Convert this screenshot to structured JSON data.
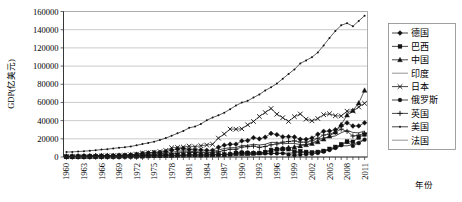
{
  "chart_data": {
    "type": "line",
    "title": "",
    "xlabel": "年份",
    "ylabel": "GDP(亿美元)",
    "ylim": [
      0,
      160000
    ],
    "ytick_step": 20000,
    "yticks": [
      "0",
      "20000",
      "40000",
      "60000",
      "80000",
      "100000",
      "120000",
      "140000",
      "160000"
    ],
    "grid": true,
    "legend_position": "right",
    "x": [
      1960,
      1961,
      1962,
      1963,
      1964,
      1965,
      1966,
      1967,
      1968,
      1969,
      1970,
      1971,
      1972,
      1973,
      1974,
      1975,
      1976,
      1977,
      1978,
      1979,
      1980,
      1981,
      1982,
      1983,
      1984,
      1985,
      1986,
      1987,
      1988,
      1989,
      1990,
      1991,
      1992,
      1993,
      1994,
      1995,
      1996,
      1997,
      1998,
      1999,
      2000,
      2001,
      2002,
      2003,
      2004,
      2005,
      2006,
      2007,
      2008,
      2009,
      2010,
      2011
    ],
    "xtick_labels": [
      "1960",
      "1963",
      "1966",
      "1969",
      "1972",
      "1975",
      "1978",
      "1981",
      "1984",
      "1987",
      "1990",
      "1993",
      "1996",
      "1999",
      "2002",
      "2005",
      "2008",
      "2011"
    ],
    "xtick_values": [
      1960,
      1963,
      1966,
      1969,
      1972,
      1975,
      1978,
      1981,
      1984,
      1987,
      1990,
      1993,
      1996,
      1999,
      2002,
      2005,
      2008,
      2011
    ],
    "series": [
      {
        "name": "德国",
        "marker": "diamond",
        "values": [
          920,
          990,
          1100,
          1180,
          1300,
          1450,
          1570,
          1600,
          1700,
          1960,
          2150,
          2500,
          3050,
          4010,
          4450,
          4950,
          5100,
          5930,
          7400,
          8800,
          9460,
          8200,
          7800,
          7760,
          7380,
          7360,
          10700,
          13000,
          14000,
          14100,
          17650,
          18100,
          21300,
          20000,
          21800,
          25900,
          24600,
          22200,
          22400,
          22000,
          19500,
          19400,
          20800,
          25000,
          28200,
          28600,
          30000,
          34400,
          37500,
          34100,
          34200,
          37600
        ]
      },
      {
        "name": "巴西",
        "marker": "square",
        "values": [
          150,
          155,
          200,
          230,
          210,
          220,
          270,
          300,
          340,
          370,
          420,
          490,
          580,
          790,
          1050,
          1235,
          1520,
          1760,
          2020,
          2250,
          2350,
          2580,
          2710,
          2030,
          2070,
          2220,
          2680,
          2820,
          3060,
          4250,
          4620,
          4070,
          3900,
          4380,
          5460,
          7690,
          8500,
          8830,
          8630,
          5860,
          6440,
          5540,
          5070,
          5580,
          6690,
          8920,
          11070,
          13970,
          16950,
          16670,
          21430,
          24760
        ]
      },
      {
        "name": "中国",
        "marker": "triangle",
        "values": [
          597,
          501,
          470,
          501,
          597,
          705,
          763,
          722,
          700,
          786,
          925,
          990,
          1130,
          1380,
          1440,
          1635,
          1520,
          1725,
          1495,
          1780,
          1890,
          1960,
          2050,
          2300,
          2600,
          3090,
          2980,
          2720,
          3100,
          3470,
          3600,
          3830,
          4270,
          4400,
          5620,
          7340,
          8600,
          9530,
          10200,
          10940,
          12110,
          13390,
          14710,
          16600,
          19550,
          22870,
          27290,
          35520,
          45980,
          51100,
          59300,
          73180
        ]
      },
      {
        "name": "印度",
        "marker": "none",
        "values": [
          370,
          392,
          415,
          480,
          561,
          600,
          457,
          509,
          533,
          587,
          625,
          676,
          703,
          851,
          994,
          985,
          1021,
          1210,
          1376,
          1525,
          1863,
          1937,
          2009,
          2223,
          2124,
          2326,
          2489,
          2797,
          2966,
          2960,
          3267,
          2743,
          2881,
          2841,
          3337,
          3661,
          3996,
          4232,
          4284,
          4648,
          4746,
          4937,
          5238,
          6182,
          7215,
          8342,
          9497,
          12389,
          12248,
          13658,
          17088,
          18726
        ]
      },
      {
        "name": "日本",
        "marker": "cross",
        "values": [
          443,
          535,
          604,
          689,
          817,
          909,
          1058,
          1235,
          1469,
          1726,
          2126,
          2406,
          3180,
          4321,
          4800,
          5216,
          5963,
          7216,
          10130,
          10560,
          10870,
          11980,
          11350,
          12430,
          13180,
          13990,
          20740,
          25310,
          30720,
          30530,
          31030,
          35360,
          39080,
          44540,
          48910,
          53340,
          47070,
          43240,
          39140,
          44320,
          47310,
          41620,
          39800,
          42290,
          46500,
          47550,
          45300,
          45150,
          50370,
          50350,
          54950,
          59050
        ]
      },
      {
        "name": "俄罗斯",
        "marker": "circle",
        "values": [
          null,
          null,
          null,
          null,
          null,
          null,
          null,
          null,
          null,
          null,
          null,
          null,
          null,
          null,
          null,
          null,
          null,
          null,
          null,
          null,
          null,
          null,
          null,
          null,
          null,
          null,
          null,
          null,
          null,
          5060,
          5170,
          5090,
          4600,
          4350,
          3950,
          3960,
          3920,
          4050,
          2710,
          1960,
          2600,
          3070,
          3450,
          4300,
          5910,
          7640,
          9900,
          12990,
          16600,
          12220,
          15250,
          19050
        ]
      },
      {
        "name": "英国",
        "marker": "plus",
        "values": [
          730,
          770,
          810,
          870,
          950,
          1010,
          1070,
          1110,
          1050,
          1120,
          1260,
          1430,
          1620,
          1820,
          1960,
          2400,
          2320,
          2640,
          3350,
          4290,
          5420,
          5150,
          4890,
          4660,
          4510,
          4710,
          5770,
          7050,
          8540,
          8460,
          10940,
          11370,
          11990,
          10620,
          11510,
          13410,
          14310,
          16320,
          17100,
          17680,
          16400,
          16320,
          17840,
          20530,
          24120,
          25200,
          27150,
          30650,
          28170,
          23090,
          24080,
          25920
        ]
      },
      {
        "name": "美国",
        "marker": "dot",
        "values": [
          5433,
          5633,
          6051,
          6386,
          6858,
          7437,
          8151,
          8617,
          9425,
          10199,
          10759,
          11644,
          12797,
          14255,
          15478,
          16881,
          18734,
          20803,
          23378,
          26011,
          28626,
          32071,
          33439,
          36340,
          40378,
          43386,
          45796,
          48701,
          52527,
          56574,
          59798,
          61740,
          65393,
          68786,
          73089,
          76640,
          80731,
          86088,
          91348,
          96308,
          102898,
          106218,
          109775,
          114966,
          122749,
          130937,
          138558,
          144804,
          147202,
          143694,
          149642,
          155338
        ]
      },
      {
        "name": "法国",
        "marker": "none",
        "values": [
          622,
          678,
          774,
          877,
          989,
          1047,
          1144,
          1240,
          1320,
          1430,
          1483,
          1651,
          2006,
          2646,
          2860,
          3600,
          3730,
          4080,
          5070,
          6200,
          7010,
          6270,
          5860,
          5580,
          5300,
          5530,
          7700,
          9350,
          10180,
          10300,
          12690,
          12710,
          14040,
          13210,
          14020,
          16100,
          16070,
          14530,
          15010,
          14900,
          13620,
          13800,
          14990,
          18440,
          21170,
          21960,
          23200,
          26600,
          29370,
          27000,
          26530,
          28622
        ]
      }
    ]
  },
  "axis": {
    "y_title": "GDP(亿美元)",
    "x_title": "年份"
  }
}
